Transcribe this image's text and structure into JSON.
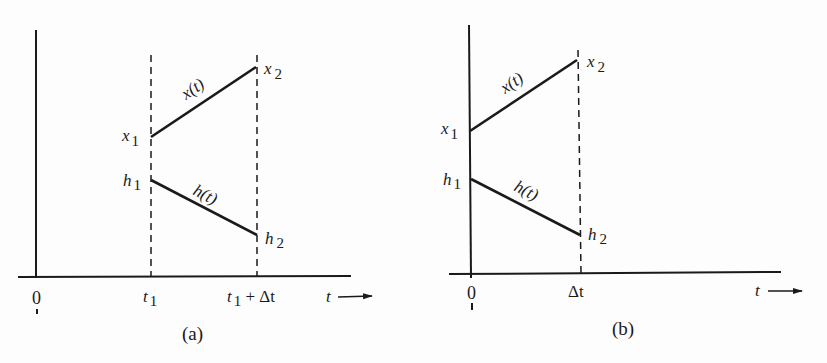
{
  "panels": [
    {
      "id": "a",
      "caption": "(a)",
      "labels": {
        "x1": "x",
        "x1_sub": "1",
        "x2": "x",
        "x2_sub": "2",
        "h1": "h",
        "h1_sub": "1",
        "h2": "h",
        "h2_sub": "2",
        "xt": "x(t)",
        "ht": "h(t)",
        "origin": "0",
        "tick1": "t",
        "tick1_sub": "1",
        "tick2_pre": "t",
        "tick2_sub": "1",
        "tick2_post": " + Δt",
        "t_axis": "t"
      }
    },
    {
      "id": "b",
      "caption": "(b)",
      "labels": {
        "x1": "x",
        "x1_sub": "1",
        "x2": "x",
        "x2_sub": "2",
        "h1": "h",
        "h1_sub": "1",
        "h2": "h",
        "h2_sub": "2",
        "xt": "x(t)",
        "ht": "h(t)",
        "origin": "0",
        "tick1": "Δt",
        "t_axis": "t"
      }
    }
  ],
  "colors": {
    "ink": "#1a1a1a",
    "background": "#fdfdfd"
  }
}
